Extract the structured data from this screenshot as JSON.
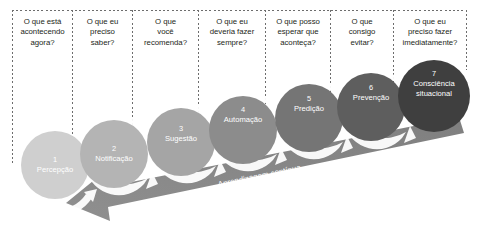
{
  "diagram": {
    "questions": [
      {
        "id": "q1",
        "lines": [
          "O que está",
          "acontecendo",
          "agora?"
        ]
      },
      {
        "id": "q2",
        "lines": [
          "O que eu",
          "preciso",
          "saber?"
        ]
      },
      {
        "id": "q3",
        "lines": [
          "O que",
          "você",
          "recomenda?"
        ]
      },
      {
        "id": "q4",
        "lines": [
          "O que eu",
          "deveria fazer",
          "sempre?"
        ]
      },
      {
        "id": "q5",
        "lines": [
          "O que posso",
          "esperar que",
          "aconteça?"
        ]
      },
      {
        "id": "q6",
        "lines": [
          "O que",
          "consigo",
          "evitar?"
        ]
      },
      {
        "id": "q7",
        "lines": [
          "O que eu",
          "preciso fazer",
          "imediatamente?"
        ]
      }
    ],
    "stages": [
      {
        "num": "1",
        "name": "Percepção",
        "color": "#cfcfcf"
      },
      {
        "num": "2",
        "name": "Notificação",
        "color": "#b4b4b4"
      },
      {
        "num": "3",
        "name": "Sugestão",
        "color": "#a5a5a5"
      },
      {
        "num": "4",
        "name": "Automação",
        "color": "#8c8c8c"
      },
      {
        "num": "5",
        "name": "Predição",
        "color": "#757575"
      },
      {
        "num": "6",
        "name": "Prevenção",
        "color": "#5e5e5e"
      },
      {
        "num": "7",
        "name": "Consciência situacional",
        "color": "#3f3f3f"
      }
    ],
    "band": {
      "label": "Aprendizagem contínua",
      "color": "#8a8a8a"
    },
    "colors": {
      "text": "#231f20",
      "dashes": "#6d6d6d",
      "arrow_loop": "#ffffff",
      "background": "#ffffff"
    }
  }
}
